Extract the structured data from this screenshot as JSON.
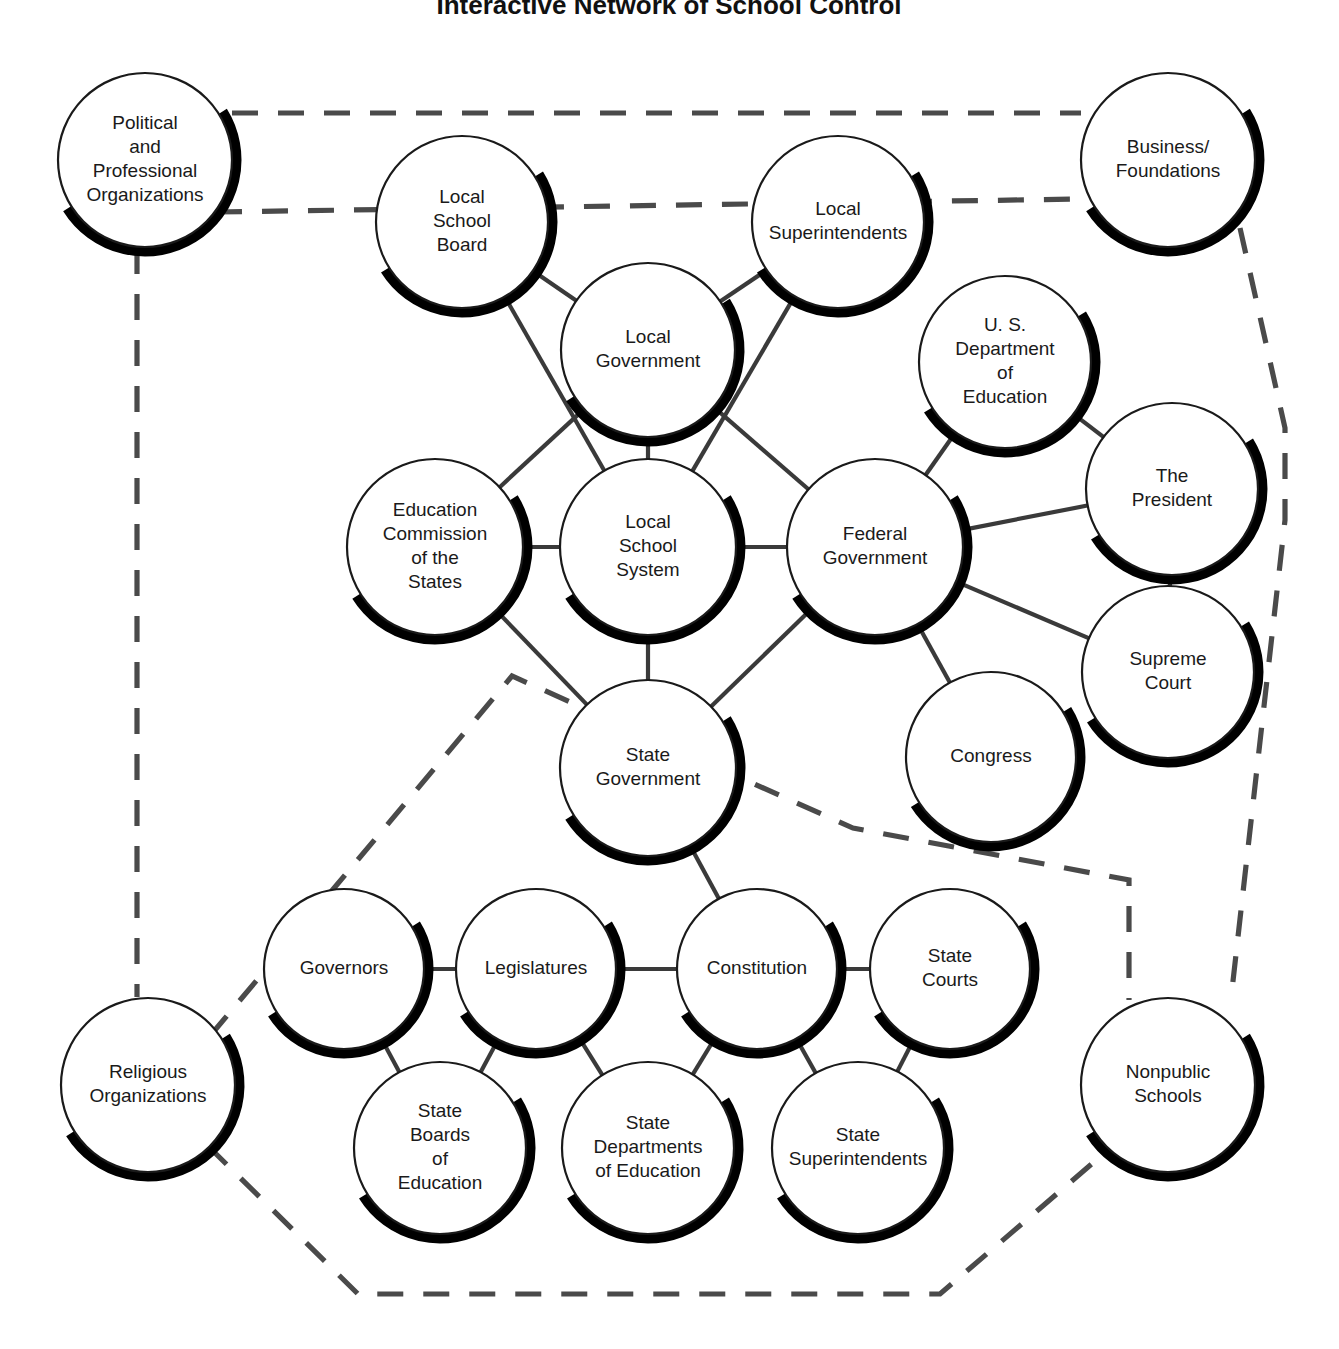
{
  "title": "Interactive Network of School Control",
  "colors": {
    "background": "#ffffff",
    "outline": "#1a1a1a",
    "shadow": "#000000",
    "solid_link": "#3a3a3a",
    "dashed_link": "#4a4a4a",
    "text": "#1a1a1a"
  },
  "chart_data": {
    "type": "diagram",
    "title": "Interactive Network of School Control",
    "subtitle": "",
    "legend": [],
    "layout": {
      "width": 1339,
      "height": 1349,
      "solid_line_meaning": "direct structural link",
      "dashed_line_meaning": "indirect / external influence boundary"
    },
    "nodes": [
      {
        "id": "political",
        "label": "Political\nand\nProfessional\nOrganizations",
        "cx": 145,
        "cy": 160,
        "r": 87,
        "font": 19,
        "style": "shadow"
      },
      {
        "id": "business",
        "label": "Business/\nFoundations",
        "cx": 1168,
        "cy": 160,
        "r": 87,
        "font": 19,
        "style": "shadow"
      },
      {
        "id": "localboard",
        "label": "Local\nSchool\nBoard",
        "cx": 462,
        "cy": 222,
        "r": 86,
        "font": 19,
        "style": "shadow"
      },
      {
        "id": "localsupt",
        "label": "Local\nSuperintendents",
        "cx": 838,
        "cy": 222,
        "r": 86,
        "font": 19,
        "style": "shadow"
      },
      {
        "id": "localgov",
        "label": "Local\nGovernment",
        "cx": 648,
        "cy": 350,
        "r": 87,
        "font": 19,
        "style": "shadow"
      },
      {
        "id": "usdoe",
        "label": "U. S.\nDepartment\nof\nEducation",
        "cx": 1005,
        "cy": 362,
        "r": 86,
        "font": 19,
        "style": "shadow"
      },
      {
        "id": "president",
        "label": "The\nPresident",
        "cx": 1172,
        "cy": 489,
        "r": 86,
        "font": 19,
        "style": "shadow"
      },
      {
        "id": "ecs",
        "label": "Education\nCommission\nof the\nStates",
        "cx": 435,
        "cy": 547,
        "r": 88,
        "font": 19,
        "style": "shadow"
      },
      {
        "id": "lss",
        "label": "Local\nSchool\nSystem",
        "cx": 648,
        "cy": 547,
        "r": 88,
        "font": 19,
        "style": "shadow"
      },
      {
        "id": "fedgov",
        "label": "Federal\nGovernment",
        "cx": 875,
        "cy": 547,
        "r": 88,
        "font": 19,
        "style": "shadow"
      },
      {
        "id": "scotus",
        "label": "Supreme\nCourt",
        "cx": 1168,
        "cy": 672,
        "r": 86,
        "font": 19,
        "style": "shadow"
      },
      {
        "id": "congress",
        "label": "Congress",
        "cx": 991,
        "cy": 757,
        "r": 85,
        "font": 19,
        "style": "shadow"
      },
      {
        "id": "stategov",
        "label": "State\nGovernment",
        "cx": 648,
        "cy": 768,
        "r": 88,
        "font": 19,
        "style": "shadow"
      },
      {
        "id": "religious",
        "label": "Religious\nOrganizations",
        "cx": 148,
        "cy": 1085,
        "r": 87,
        "font": 19,
        "style": "shadow"
      },
      {
        "id": "nonpublic",
        "label": "Nonpublic\nSchools",
        "cx": 1168,
        "cy": 1085,
        "r": 87,
        "font": 19,
        "style": "shadow"
      },
      {
        "id": "governors",
        "label": "Governors",
        "cx": 344,
        "cy": 969,
        "r": 80,
        "font": 19,
        "style": "shadow"
      },
      {
        "id": "legislatures",
        "label": "Legislatures",
        "cx": 536,
        "cy": 969,
        "r": 80,
        "font": 19,
        "style": "shadow"
      },
      {
        "id": "constitution",
        "label": "Constitution",
        "cx": 757,
        "cy": 969,
        "r": 80,
        "font": 19,
        "style": "shadow"
      },
      {
        "id": "statecourts",
        "label": "State\nCourts",
        "cx": 950,
        "cy": 969,
        "r": 80,
        "font": 19,
        "style": "shadow"
      },
      {
        "id": "stateboards",
        "label": "State\nBoards\nof\nEducation",
        "cx": 440,
        "cy": 1148,
        "r": 86,
        "font": 19,
        "style": "shadow"
      },
      {
        "id": "statedepts",
        "label": "State\nDepartments\nof Education",
        "cx": 648,
        "cy": 1148,
        "r": 86,
        "font": 19,
        "style": "shadow"
      },
      {
        "id": "statesupts",
        "label": "State\nSuperintendents",
        "cx": 858,
        "cy": 1148,
        "r": 86,
        "font": 19,
        "style": "shadow"
      }
    ],
    "solid_links": [
      {
        "from": "localboard",
        "to": "localgov"
      },
      {
        "from": "localsupt",
        "to": "localgov"
      },
      {
        "from": "localboard",
        "to": "lss"
      },
      {
        "from": "localsupt",
        "to": "lss"
      },
      {
        "from": "localgov",
        "to": "ecs"
      },
      {
        "from": "localgov",
        "to": "lss"
      },
      {
        "from": "localgov",
        "to": "fedgov"
      },
      {
        "from": "ecs",
        "to": "lss"
      },
      {
        "from": "lss",
        "to": "fedgov"
      },
      {
        "from": "usdoe",
        "to": "fedgov"
      },
      {
        "from": "usdoe",
        "to": "president"
      },
      {
        "from": "president",
        "to": "fedgov"
      },
      {
        "from": "president",
        "to": "scotus"
      },
      {
        "from": "scotus",
        "to": "fedgov"
      },
      {
        "from": "congress",
        "to": "fedgov"
      },
      {
        "from": "lss",
        "to": "stategov"
      },
      {
        "from": "ecs",
        "to": "stategov"
      },
      {
        "from": "fedgov",
        "to": "stategov"
      },
      {
        "from": "stategov",
        "to": "constitution"
      },
      {
        "from": "governors",
        "to": "legislatures"
      },
      {
        "from": "legislatures",
        "to": "constitution"
      },
      {
        "from": "constitution",
        "to": "statecourts"
      },
      {
        "from": "governors",
        "to": "stateboards"
      },
      {
        "from": "legislatures",
        "to": "stateboards"
      },
      {
        "from": "legislatures",
        "to": "statedepts"
      },
      {
        "from": "constitution",
        "to": "statedepts"
      },
      {
        "from": "constitution",
        "to": "statesupts"
      },
      {
        "from": "statecourts",
        "to": "statesupts"
      }
    ],
    "dashed_paths": [
      {
        "id": "political-to-business",
        "points": "232,113 1081,113"
      },
      {
        "id": "political-to-fedgov-area",
        "points": "216,212 1083,199"
      },
      {
        "id": "political-down-left",
        "points": "137,248 137,997"
      },
      {
        "id": "business-right-boundary",
        "points": "1240,228 1285,428 1285,520 1232,990"
      },
      {
        "id": "religious-to-bottom-loop",
        "points": "210,1036 512,676 853,828 1129,880 1129,1000"
      },
      {
        "id": "bottom-loop",
        "points": "208,1146 358,1294 940,1294 1108,1150"
      }
    ]
  }
}
